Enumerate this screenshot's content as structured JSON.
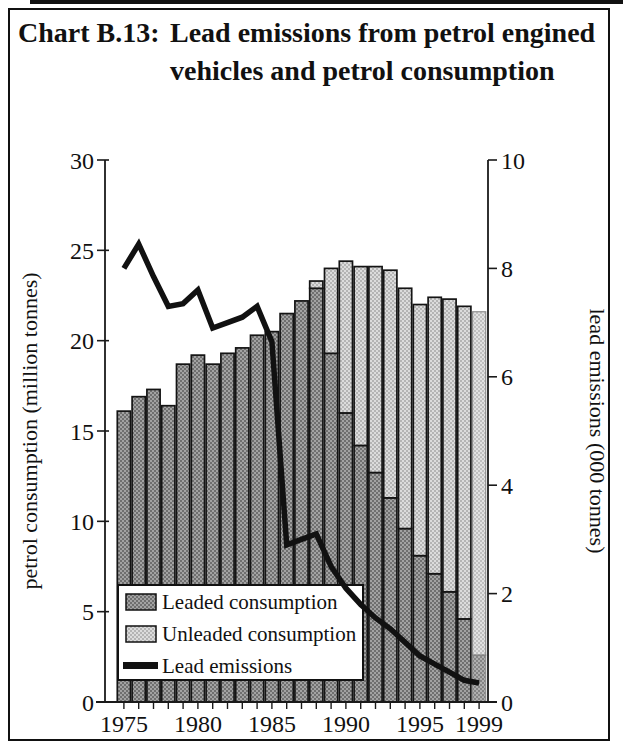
{
  "figure": {
    "title_label": "Chart B.13:",
    "title_text": "Lead emissions from petrol engined vehicles and petrol consumption"
  },
  "chart_data": {
    "type": "bar",
    "stacked": true,
    "overlay": "line",
    "categories": [
      1975,
      1976,
      1977,
      1978,
      1979,
      1980,
      1981,
      1982,
      1983,
      1984,
      1985,
      1986,
      1987,
      1988,
      1989,
      1990,
      1991,
      1992,
      1993,
      1994,
      1995,
      1996,
      1997,
      1998,
      1999
    ],
    "series": [
      {
        "name": "Leaded consumption",
        "type": "bar",
        "axis": "left",
        "values": [
          16.1,
          16.9,
          17.3,
          16.4,
          18.7,
          19.2,
          18.7,
          19.3,
          19.6,
          20.3,
          20.5,
          21.5,
          22.2,
          22.9,
          19.3,
          16.0,
          14.2,
          12.7,
          11.3,
          9.6,
          8.1,
          7.1,
          6.1,
          4.6,
          2.6
        ]
      },
      {
        "name": "Unleaded consumption",
        "type": "bar",
        "axis": "left",
        "values": [
          0,
          0,
          0,
          0,
          0,
          0,
          0,
          0,
          0,
          0,
          0,
          0,
          0,
          0.4,
          4.7,
          8.4,
          9.9,
          11.4,
          12.6,
          13.3,
          13.9,
          15.3,
          16.2,
          17.3,
          19.0
        ]
      },
      {
        "name": "Lead emissions",
        "type": "line",
        "axis": "right",
        "values": [
          8.0,
          8.45,
          7.85,
          7.3,
          7.35,
          7.6,
          6.9,
          7.0,
          7.1,
          7.3,
          6.65,
          2.9,
          3.0,
          3.1,
          2.5,
          2.1,
          1.8,
          1.55,
          1.35,
          1.1,
          0.85,
          0.7,
          0.55,
          0.4,
          0.35
        ]
      }
    ],
    "left_axis": {
      "label": "petrol consumption (million tonnes)",
      "range": [
        0,
        30
      ],
      "ticks": [
        30,
        25,
        20,
        15,
        10,
        5,
        0
      ]
    },
    "right_axis": {
      "label": "lead emissions (000 tonnes)",
      "range": [
        0,
        10
      ],
      "ticks": [
        10,
        8,
        6,
        4,
        2,
        0
      ]
    },
    "x_axis": {
      "labeled_ticks": [
        1975,
        1980,
        1985,
        1990,
        1995,
        1999
      ]
    },
    "legend": {
      "position": "inside-bottom-left",
      "items": [
        "Leaded consumption",
        "Unleaded consumption",
        "Lead emissions"
      ]
    },
    "colors": {
      "leaded_base": "#a2a2a2",
      "leaded_dot": "#6f6f6f",
      "unleaded_base": "#dcdcdc",
      "unleaded_dot": "#b4b4b4",
      "line": "#111111",
      "axis": "#1a1a1a"
    }
  }
}
